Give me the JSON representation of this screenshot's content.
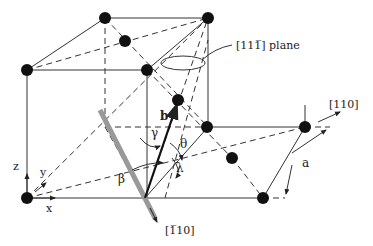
{
  "diagram": {
    "labels": {
      "plane": "[11̅1] plane",
      "plane_text": "[111̅] plane",
      "dir_110": "[110]",
      "dir_1m10": "[11̅0]",
      "dir_1m10_text": "[1̅10]",
      "b": "b",
      "gamma": "γ",
      "theta": "θ",
      "beta": "β",
      "lambda": "λ",
      "a": "a",
      "x": "x",
      "y": "y",
      "z": "z"
    },
    "atoms": [
      {
        "x": 105,
        "y": 18
      },
      {
        "x": 208,
        "y": 18
      },
      {
        "x": 27,
        "y": 70
      },
      {
        "x": 147,
        "y": 70
      },
      {
        "x": 125,
        "y": 41
      },
      {
        "x": 178,
        "y": 100
      },
      {
        "x": 207,
        "y": 127
      },
      {
        "x": 305,
        "y": 127
      },
      {
        "x": 232,
        "y": 158
      },
      {
        "x": 27,
        "y": 198
      },
      {
        "x": 263,
        "y": 198
      }
    ],
    "colors": {
      "line": "#333333",
      "atom": "#111111",
      "slip_bar": "#999999"
    }
  }
}
